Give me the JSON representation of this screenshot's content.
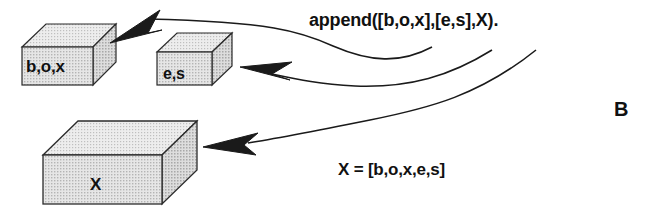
{
  "figure": {
    "panel_letter": "B",
    "background_color": "#ffffff",
    "line_color": "#1a1a1a",
    "box_fill_color": "#d3d3d3",
    "box_top_fill_color": "#dcdcdc",
    "box_side_fill_color": "#c8c8c8",
    "text_color": "#111111"
  },
  "boxes": [
    {
      "id": "box-list-box",
      "label": "b,o,x",
      "role": "first-input-list"
    },
    {
      "id": "box-list-es",
      "label": "e,s",
      "role": "second-input-list"
    },
    {
      "id": "box-list-x",
      "label": "X",
      "role": "output-list"
    }
  ],
  "annotations": {
    "append_call": "append([b,o,x],[e,s],X).",
    "result_equation": "X = [b,o,x,e,s]"
  },
  "arrows": [
    {
      "id": "arrow-to-box",
      "from": "append-arg-1",
      "to": "box-list-box"
    },
    {
      "id": "arrow-to-es",
      "from": "append-arg-2",
      "to": "box-list-es"
    },
    {
      "id": "arrow-to-x",
      "from": "append-arg-3",
      "to": "box-list-x"
    }
  ]
}
